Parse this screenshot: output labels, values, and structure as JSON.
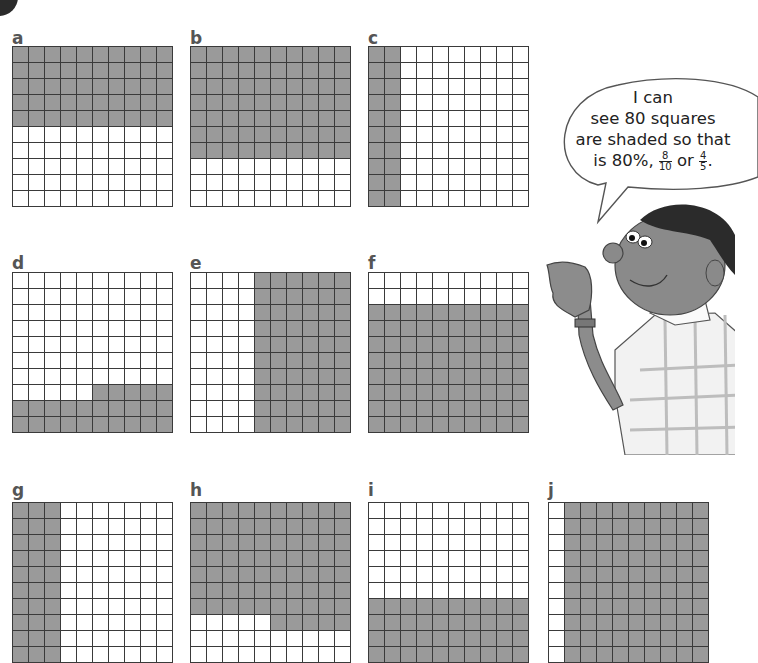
{
  "page": {
    "colors": {
      "shaded": "#9a9a9a",
      "unshaded": "#ffffff",
      "grid_line": "#3a3a3a"
    }
  },
  "grids": [
    {
      "label": "a",
      "shaded_count": 50,
      "description": "top 5 rows shaded",
      "rows": [
        "1111111111",
        "1111111111",
        "1111111111",
        "1111111111",
        "1111111111",
        "0000000000",
        "0000000000",
        "0000000000",
        "0000000000",
        "0000000000"
      ]
    },
    {
      "label": "b",
      "shaded_count": 70,
      "description": "top 7 rows shaded",
      "rows": [
        "1111111111",
        "1111111111",
        "1111111111",
        "1111111111",
        "1111111111",
        "1111111111",
        "1111111111",
        "0000000000",
        "0000000000",
        "0000000000"
      ]
    },
    {
      "label": "c",
      "shaded_count": 20,
      "description": "left 2 columns shaded",
      "rows": [
        "1100000000",
        "1100000000",
        "1100000000",
        "1100000000",
        "1100000000",
        "1100000000",
        "1100000000",
        "1100000000",
        "1100000000",
        "1100000000"
      ]
    },
    {
      "label": "d",
      "shaded_count": 25,
      "description": "bottom 2 rows and right half of row 8 shaded",
      "rows": [
        "0000000000",
        "0000000000",
        "0000000000",
        "0000000000",
        "0000000000",
        "0000000000",
        "0000000000",
        "0000011111",
        "1111111111",
        "1111111111"
      ]
    },
    {
      "label": "e",
      "shaded_count": 60,
      "description": "right 6 columns shaded",
      "rows": [
        "0000111111",
        "0000111111",
        "0000111111",
        "0000111111",
        "0000111111",
        "0000111111",
        "0000111111",
        "0000111111",
        "0000111111",
        "0000111111"
      ]
    },
    {
      "label": "f",
      "shaded_count": 80,
      "description": "bottom 8 rows shaded",
      "rows": [
        "0000000000",
        "0000000000",
        "1111111111",
        "1111111111",
        "1111111111",
        "1111111111",
        "1111111111",
        "1111111111",
        "1111111111",
        "1111111111"
      ]
    },
    {
      "label": "g",
      "shaded_count": 30,
      "description": "left 3 columns shaded",
      "rows": [
        "1110000000",
        "1110000000",
        "1110000000",
        "1110000000",
        "1110000000",
        "1110000000",
        "1110000000",
        "1110000000",
        "1110000000",
        "1110000000"
      ]
    },
    {
      "label": "h",
      "shaded_count": 75,
      "description": "top 7 rows and right half of row 8 shaded",
      "rows": [
        "1111111111",
        "1111111111",
        "1111111111",
        "1111111111",
        "1111111111",
        "1111111111",
        "1111111111",
        "0000011111",
        "0000000000",
        "0000000000"
      ]
    },
    {
      "label": "i",
      "shaded_count": 40,
      "description": "bottom 4 rows shaded",
      "rows": [
        "0000000000",
        "0000000000",
        "0000000000",
        "0000000000",
        "0000000000",
        "0000000000",
        "1111111111",
        "1111111111",
        "1111111111",
        "1111111111"
      ]
    },
    {
      "label": "j",
      "shaded_count": 90,
      "description": "right 9 columns shaded",
      "rows": [
        "0111111111",
        "0111111111",
        "0111111111",
        "0111111111",
        "0111111111",
        "0111111111",
        "0111111111",
        "0111111111",
        "0111111111",
        "0111111111"
      ]
    }
  ],
  "speech_bubble": {
    "line1": "I can",
    "line2": "see 80 squares",
    "line3": "are shaded so that",
    "line4_prefix": "is 80%,",
    "fraction1": {
      "numerator": "8",
      "denominator": "10"
    },
    "connector": "or",
    "fraction2": {
      "numerator": "4",
      "denominator": "5"
    },
    "suffix": "."
  },
  "illustration": {
    "name": "boy pointing",
    "description": "cartoon boy in checked shirt pointing at the grids"
  }
}
